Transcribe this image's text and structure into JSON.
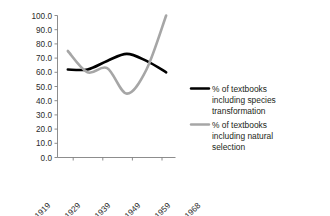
{
  "chart_data": {
    "type": "line",
    "title": "",
    "subtitle": "",
    "xlabel": "",
    "ylabel": "",
    "categories": [
      "1900-1919",
      "1920-1929",
      "1930-1939",
      "1940-1949",
      "1950-1959",
      "1960-1968"
    ],
    "ylim": [
      0.0,
      100.0
    ],
    "y_ticks": [
      "0.0",
      "10.0",
      "20.0",
      "30.0",
      "40.0",
      "50.0",
      "60.0",
      "70.0",
      "80.0",
      "90.0",
      "100.0"
    ],
    "y_tick_values": [
      0,
      10,
      20,
      30,
      40,
      50,
      60,
      70,
      80,
      90,
      100
    ],
    "grid": false,
    "legend_position": "right",
    "series": [
      {
        "name": "% of textbooks including species transformation",
        "color": "#000000",
        "values": [
          62,
          62,
          68,
          73,
          68,
          60
        ]
      },
      {
        "name": "% of textbooks including natural selection",
        "color": "#a6a6a6",
        "values": [
          75,
          60,
          63,
          45,
          62,
          100
        ]
      }
    ]
  },
  "legend": {
    "entries": [
      {
        "label_line1": "% of textbooks",
        "label_line2": "including species",
        "label_line3": "transformation",
        "swatch_color": "#000000"
      },
      {
        "label_line1": "% of textbooks",
        "label_line2": "including natural",
        "label_line3": "selection",
        "swatch_color": "#a6a6a6"
      }
    ]
  },
  "axis": {
    "line_color": "#808080"
  }
}
